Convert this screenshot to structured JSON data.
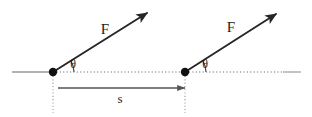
{
  "figure": {
    "type": "physics-vector-diagram",
    "background_color": "#ffffff",
    "width": 312,
    "height": 117
  },
  "colors": {
    "vector_stroke": "#262626",
    "point_fill": "#111111",
    "baseline_solid": "#9a9a9a",
    "baseline_dotted": "#9a9a9a",
    "extension_dotted": "#9a9a9a",
    "dimension_line": "#555555",
    "arc_stroke": "#444444",
    "text": "#1c1c1c"
  },
  "labels": {
    "force_left": "F",
    "force_right": "F",
    "angle_left": "θ",
    "angle_right": "θ",
    "displacement": "s"
  },
  "points": [
    {
      "name": "application-point-left",
      "x": 53,
      "y": 72,
      "radius": 4.2
    },
    {
      "name": "application-point-right",
      "x": 185,
      "y": 72,
      "radius": 4.2
    }
  ],
  "vectors": [
    {
      "name": "force-vector-left",
      "label": "F",
      "tail_x": 53,
      "tail_y": 72,
      "head_x": 147,
      "head_y": 13,
      "angle_degrees": 32,
      "label_x": 105,
      "label_y": 34
    },
    {
      "name": "force-vector-right",
      "label": "F",
      "tail_x": 185,
      "tail_y": 72,
      "head_x": 276,
      "head_y": 14,
      "angle_degrees": 32,
      "label_x": 231,
      "label_y": 32
    }
  ],
  "angle_arcs": [
    {
      "name": "angle-arc-left",
      "label": "θ",
      "center_x": 53,
      "center_y": 72,
      "radius": 21,
      "label_x": 73,
      "label_y": 68
    },
    {
      "name": "angle-arc-right",
      "label": "θ",
      "center_x": 185,
      "center_y": 72,
      "radius": 21,
      "label_x": 205,
      "label_y": 68
    }
  ],
  "baseline": {
    "name": "horizontal-reference-line",
    "y": 72,
    "solid_start_x": 12,
    "solid_end_x": 53,
    "dotted_start_x": 53,
    "dotted_end_x": 283,
    "tail_solid_start_x": 283,
    "tail_solid_end_x": 301
  },
  "extension_lines": [
    {
      "name": "extension-line-left",
      "x": 53,
      "y_start": 76,
      "y_end": 113
    },
    {
      "name": "extension-line-right",
      "x": 185,
      "y_start": 76,
      "y_end": 113
    }
  ],
  "dimension": {
    "name": "displacement-dimension",
    "label": "s",
    "y": 88,
    "start_x": 58,
    "end_x": 185,
    "label_x": 120,
    "label_y": 103
  }
}
